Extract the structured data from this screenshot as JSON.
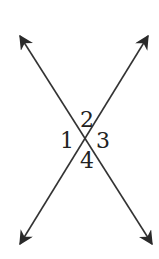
{
  "diagram": {
    "line_color": "#333333",
    "lines": [
      {
        "name": "line-a",
        "from": [
          15,
          28
        ],
        "to": [
          157,
          252
        ]
      },
      {
        "name": "line-b",
        "from": [
          153,
          28
        ],
        "to": [
          15,
          252
        ]
      }
    ],
    "intersection": [
      86,
      140
    ],
    "angle_labels": [
      {
        "id": "1",
        "text": "1",
        "x": 60,
        "y": 148
      },
      {
        "id": "2",
        "text": "2",
        "x": 80,
        "y": 127
      },
      {
        "id": "3",
        "text": "3",
        "x": 96,
        "y": 148
      },
      {
        "id": "4",
        "text": "4",
        "x": 80,
        "y": 168
      }
    ]
  }
}
